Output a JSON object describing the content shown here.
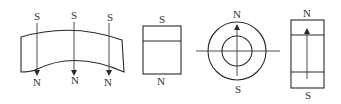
{
  "diagram": {
    "colors": {
      "line": "#2a2a2a",
      "text": "#333333",
      "background": "#ffffff"
    },
    "figures": [
      {
        "id": "arc-segment",
        "shape": "arc segment magnet",
        "poles": [
          {
            "top": "S",
            "bottom": "N"
          },
          {
            "top": "S",
            "bottom": "N"
          },
          {
            "top": "S",
            "bottom": "N"
          }
        ],
        "arrow_direction": "S to N (downward, radial)"
      },
      {
        "id": "block",
        "shape": "rectangular block magnet",
        "poles": {
          "top": "S",
          "bottom": "N"
        }
      },
      {
        "id": "ring",
        "shape": "ring magnet (top view)",
        "poles": {
          "top": "N",
          "bottom": "S"
        },
        "arrow_direction": "upward"
      },
      {
        "id": "ring-side",
        "shape": "ring magnet (side section)",
        "poles": {
          "top": "N",
          "bottom": "S"
        },
        "arrow_direction": "upward"
      }
    ]
  }
}
